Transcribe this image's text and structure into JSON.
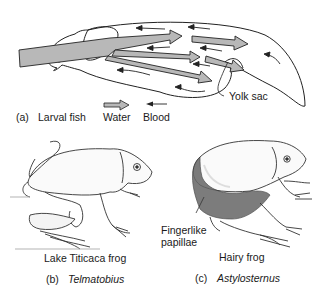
{
  "panel_a": {
    "letter": "(a)",
    "label": "Larval fish",
    "callout": "Yolk sac",
    "legend": {
      "water_label": "Water",
      "blood_label": "Blood"
    }
  },
  "panel_b": {
    "common_name": "Lake Titicaca frog",
    "letter": "(b)",
    "genus": "Telmatobius"
  },
  "panel_c": {
    "common_name": "Hairy frog",
    "letter": "(c)",
    "genus": "Astylosternus",
    "callout_line1": "Fingerlike",
    "callout_line2": "papillae"
  },
  "colors": {
    "water_arrow_fill": "#b8b8b8",
    "stroke": "#222222",
    "background": "#ffffff"
  }
}
